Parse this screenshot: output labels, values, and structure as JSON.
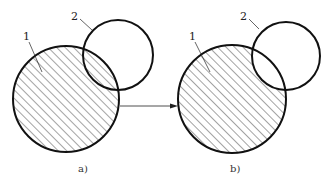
{
  "figure": {
    "panels": [
      {
        "id": "a",
        "caption": "a)",
        "labels": [
          {
            "text": "1",
            "refers_to": "large-circle"
          },
          {
            "text": "2",
            "refers_to": "small-circle"
          }
        ],
        "hatched_region": "entire large circle including overlap"
      },
      {
        "id": "b",
        "caption": "b)",
        "labels": [
          {
            "text": "1",
            "refers_to": "large-circle"
          },
          {
            "text": "2",
            "refers_to": "small-circle"
          }
        ],
        "hatched_region": "large circle minus overlap with small circle"
      }
    ],
    "arrow": {
      "from": "a",
      "to": "b"
    },
    "colors": {
      "stroke": "#111111",
      "hatch": "#333333",
      "background": "#ffffff"
    }
  }
}
